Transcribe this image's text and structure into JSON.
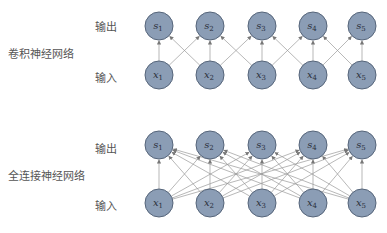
{
  "diagrams": [
    {
      "title": "卷积神经网络",
      "output_label": "输出",
      "input_label": "输入",
      "outputs": [
        "s1",
        "s2",
        "s3",
        "s4",
        "s5"
      ],
      "inputs": [
        "x1",
        "x2",
        "x3",
        "x4",
        "x5"
      ],
      "connection": "local (kernel width 3)"
    },
    {
      "title": "全连接神经网络",
      "output_label": "输出",
      "input_label": "输入",
      "outputs": [
        "s1",
        "s2",
        "s3",
        "s4",
        "s5"
      ],
      "inputs": [
        "x1",
        "x2",
        "x3",
        "x4",
        "x5"
      ],
      "connection": "full"
    }
  ],
  "colors": {
    "node_fill": "#8b9db5",
    "node_stroke": "#56657a",
    "edge": "#999999",
    "text": "#444444"
  }
}
